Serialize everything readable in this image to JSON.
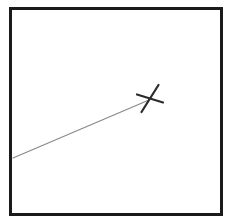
{
  "figure": {
    "title": "Diagram with leader line and X mark",
    "canvas": {
      "width": 229,
      "height": 224,
      "background": "#ffffff"
    },
    "frame": {
      "name": "border-rectangle",
      "x": 10,
      "y": 8,
      "width": 211,
      "height": 206,
      "stroke_color": "#1b1b1b",
      "stroke_width": 3,
      "fill": "#ffffff"
    },
    "leader_line": {
      "name": "leader-line",
      "x1": 13,
      "y1": 158,
      "x2": 149,
      "y2": 100,
      "stroke_color": "#8a8a8a",
      "stroke_width": 1.3
    },
    "x_marker": {
      "name": "x-mark",
      "center_x": 150,
      "center_y": 98,
      "stroke_color": "#2b2b2b",
      "stroke_width": 2.2,
      "strokes": [
        {
          "label": "down-stroke",
          "x1": 158.5,
          "y1": 85.0,
          "x2": 141.5,
          "y2": 112.0
        },
        {
          "label": "cross-stroke",
          "x1": 137.0,
          "y1": 94.5,
          "x2": 163.0,
          "y2": 102.5
        }
      ]
    }
  }
}
